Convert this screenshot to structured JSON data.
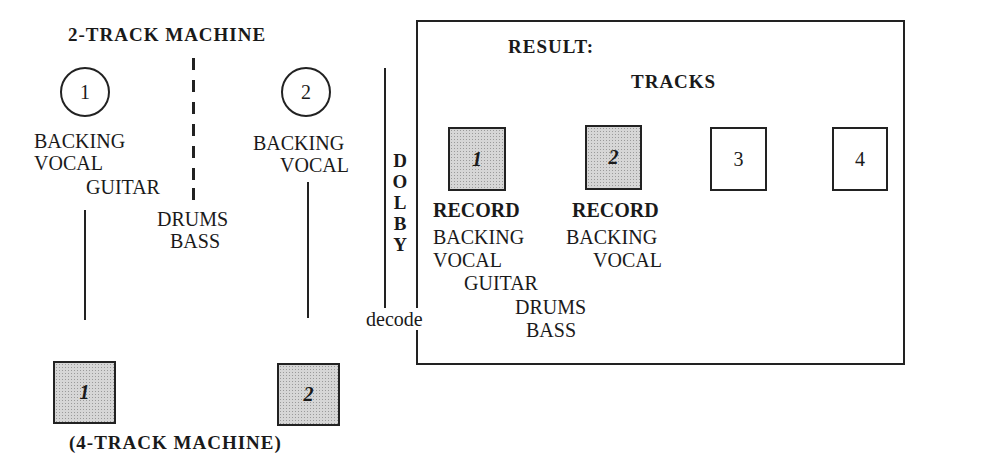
{
  "source": {
    "title": "2-TRACK MACHINE",
    "tracks": [
      {
        "number": "1",
        "contents": [
          "BACKING",
          "VOCAL",
          "GUITAR"
        ]
      },
      {
        "number": "2",
        "contents": [
          "BACKING",
          "VOCAL"
        ]
      }
    ],
    "center_label": [
      "DRUMS",
      "BASS"
    ]
  },
  "processor": {
    "letters": [
      "D",
      "O",
      "L",
      "B",
      "Y"
    ],
    "mode": "decode"
  },
  "destination": {
    "title": "(4-TRACK MACHINE)",
    "tracks": [
      "1",
      "2"
    ]
  },
  "result": {
    "title": "RESULT:",
    "subtitle": "TRACKS",
    "tracks": [
      {
        "number": "1",
        "shaded": true,
        "action": "RECORD",
        "contents": [
          "BACKING",
          "VOCAL",
          "GUITAR",
          "DRUMS",
          "BASS"
        ]
      },
      {
        "number": "2",
        "shaded": true,
        "action": "RECORD",
        "contents": [
          "BACKING",
          "VOCAL"
        ]
      },
      {
        "number": "3",
        "shaded": false
      },
      {
        "number": "4",
        "shaded": false
      }
    ]
  }
}
